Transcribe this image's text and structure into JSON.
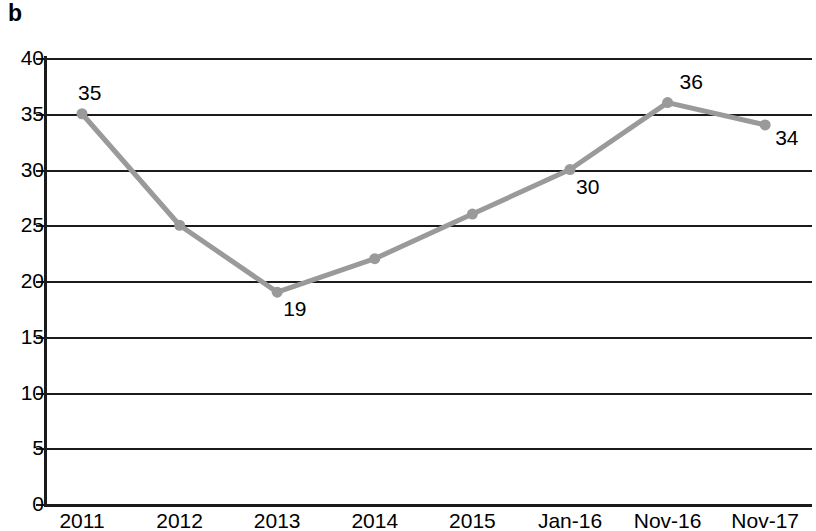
{
  "panel": {
    "label": "b"
  },
  "chart_data": {
    "type": "line",
    "title": "",
    "subtitle": "",
    "xlabel": "",
    "ylabel": "",
    "categories": [
      "2011",
      "2012",
      "2013",
      "2014",
      "2015",
      "Jan-16",
      "Nov-16",
      "Nov-17"
    ],
    "values": [
      35,
      25,
      19,
      22,
      26,
      30,
      36,
      34
    ],
    "series": [
      {
        "name": "",
        "values": [
          35,
          25,
          19,
          22,
          26,
          30,
          36,
          34
        ]
      }
    ],
    "point_labels": [
      "35",
      "",
      "19",
      "",
      "",
      "30",
      "36",
      "34"
    ],
    "ylim": [
      0,
      40
    ],
    "yticks": [
      0,
      5,
      10,
      15,
      20,
      25,
      30,
      35,
      40
    ],
    "ytick_labels": [
      "0",
      "5",
      "10",
      "15",
      "20",
      "25",
      "30",
      "35",
      "40"
    ],
    "grid": true,
    "legend": "none",
    "line_color": "#9a9a9a",
    "marker_color": "#9a9a9a",
    "axis_color": "#1b1b1b"
  }
}
